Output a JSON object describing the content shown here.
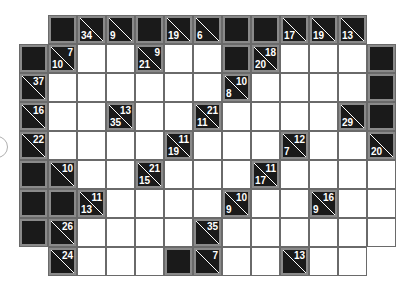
{
  "puzzle": {
    "type": "kakuro",
    "cell_size": 29,
    "origin_x": 19,
    "origin_y": 15,
    "colors": {
      "clue_bg": "#1a1a1a",
      "clue_border": "#8a8a8a",
      "white": "#ffffff",
      "grid_line": "#6a6a6a",
      "clue_text": "#ffffff"
    },
    "rows": [
      {
        "r": 0,
        "cells": [
          {
            "c": 1,
            "t": "B"
          },
          {
            "c": 2,
            "t": "C",
            "down": "34"
          },
          {
            "c": 3,
            "t": "C",
            "down": "9"
          },
          {
            "c": 4,
            "t": "B"
          },
          {
            "c": 5,
            "t": "C",
            "down": "19"
          },
          {
            "c": 6,
            "t": "C",
            "down": "6"
          },
          {
            "c": 7,
            "t": "B"
          },
          {
            "c": 8,
            "t": "B"
          },
          {
            "c": 9,
            "t": "C",
            "down": "17"
          },
          {
            "c": 10,
            "t": "C",
            "down": "19"
          },
          {
            "c": 11,
            "t": "C",
            "down": "13"
          }
        ]
      },
      {
        "r": 1,
        "cells": [
          {
            "c": 0,
            "t": "B"
          },
          {
            "c": 1,
            "t": "C",
            "across": "7",
            "down": "10"
          },
          {
            "c": 2,
            "t": "W"
          },
          {
            "c": 3,
            "t": "W"
          },
          {
            "c": 4,
            "t": "C",
            "across": "9",
            "down": "21"
          },
          {
            "c": 5,
            "t": "W"
          },
          {
            "c": 6,
            "t": "W"
          },
          {
            "c": 7,
            "t": "B"
          },
          {
            "c": 8,
            "t": "C",
            "across": "18",
            "down": "20"
          },
          {
            "c": 9,
            "t": "W"
          },
          {
            "c": 10,
            "t": "W"
          },
          {
            "c": 11,
            "t": "W"
          },
          {
            "c": 12,
            "t": "B"
          }
        ]
      },
      {
        "r": 2,
        "cells": [
          {
            "c": 0,
            "t": "C",
            "across": "37"
          },
          {
            "c": 1,
            "t": "W"
          },
          {
            "c": 2,
            "t": "W"
          },
          {
            "c": 3,
            "t": "W"
          },
          {
            "c": 4,
            "t": "W"
          },
          {
            "c": 5,
            "t": "W"
          },
          {
            "c": 6,
            "t": "W"
          },
          {
            "c": 7,
            "t": "C",
            "across": "10",
            "down": "8"
          },
          {
            "c": 8,
            "t": "W"
          },
          {
            "c": 9,
            "t": "W"
          },
          {
            "c": 10,
            "t": "W"
          },
          {
            "c": 11,
            "t": "W"
          },
          {
            "c": 12,
            "t": "B"
          }
        ]
      },
      {
        "r": 3,
        "cells": [
          {
            "c": 0,
            "t": "C",
            "across": "16"
          },
          {
            "c": 1,
            "t": "W"
          },
          {
            "c": 2,
            "t": "W"
          },
          {
            "c": 3,
            "t": "C",
            "across": "13",
            "down": "35"
          },
          {
            "c": 4,
            "t": "W"
          },
          {
            "c": 5,
            "t": "W"
          },
          {
            "c": 6,
            "t": "C",
            "across": "21",
            "down": "11"
          },
          {
            "c": 7,
            "t": "W"
          },
          {
            "c": 8,
            "t": "W"
          },
          {
            "c": 9,
            "t": "W"
          },
          {
            "c": 10,
            "t": "W"
          },
          {
            "c": 11,
            "t": "C",
            "down": "29"
          },
          {
            "c": 12,
            "t": "B"
          }
        ]
      },
      {
        "r": 4,
        "cells": [
          {
            "c": 0,
            "t": "C",
            "across": "22"
          },
          {
            "c": 1,
            "t": "W"
          },
          {
            "c": 2,
            "t": "W"
          },
          {
            "c": 3,
            "t": "W"
          },
          {
            "c": 4,
            "t": "W"
          },
          {
            "c": 5,
            "t": "C",
            "across": "11",
            "down": "19"
          },
          {
            "c": 6,
            "t": "W"
          },
          {
            "c": 7,
            "t": "W"
          },
          {
            "c": 8,
            "t": "W"
          },
          {
            "c": 9,
            "t": "C",
            "across": "12",
            "down": "7"
          },
          {
            "c": 10,
            "t": "W"
          },
          {
            "c": 11,
            "t": "W"
          },
          {
            "c": 12,
            "t": "C",
            "down": "20"
          }
        ]
      },
      {
        "r": 5,
        "cells": [
          {
            "c": 0,
            "t": "B"
          },
          {
            "c": 1,
            "t": "C",
            "across": "10"
          },
          {
            "c": 2,
            "t": "W"
          },
          {
            "c": 3,
            "t": "W"
          },
          {
            "c": 4,
            "t": "C",
            "across": "21",
            "down": "15"
          },
          {
            "c": 5,
            "t": "W"
          },
          {
            "c": 6,
            "t": "W"
          },
          {
            "c": 7,
            "t": "W"
          },
          {
            "c": 8,
            "t": "C",
            "across": "11",
            "down": "17"
          },
          {
            "c": 9,
            "t": "W"
          },
          {
            "c": 10,
            "t": "W"
          },
          {
            "c": 11,
            "t": "W"
          },
          {
            "c": 12,
            "t": "W"
          }
        ]
      },
      {
        "r": 6,
        "cells": [
          {
            "c": 0,
            "t": "B"
          },
          {
            "c": 1,
            "t": "B"
          },
          {
            "c": 2,
            "t": "C",
            "across": "11",
            "down": "13"
          },
          {
            "c": 3,
            "t": "W"
          },
          {
            "c": 4,
            "t": "W"
          },
          {
            "c": 5,
            "t": "W"
          },
          {
            "c": 6,
            "t": "W"
          },
          {
            "c": 7,
            "t": "C",
            "across": "10",
            "down": "9"
          },
          {
            "c": 8,
            "t": "W"
          },
          {
            "c": 9,
            "t": "W"
          },
          {
            "c": 10,
            "t": "C",
            "across": "16",
            "down": "9"
          },
          {
            "c": 11,
            "t": "W"
          },
          {
            "c": 12,
            "t": "W"
          }
        ]
      },
      {
        "r": 7,
        "cells": [
          {
            "c": 0,
            "t": "B"
          },
          {
            "c": 1,
            "t": "C",
            "across": "26"
          },
          {
            "c": 2,
            "t": "W"
          },
          {
            "c": 3,
            "t": "W"
          },
          {
            "c": 4,
            "t": "W"
          },
          {
            "c": 5,
            "t": "W"
          },
          {
            "c": 6,
            "t": "C",
            "across": "35"
          },
          {
            "c": 7,
            "t": "W"
          },
          {
            "c": 8,
            "t": "W"
          },
          {
            "c": 9,
            "t": "W"
          },
          {
            "c": 10,
            "t": "W"
          },
          {
            "c": 11,
            "t": "W"
          },
          {
            "c": 12,
            "t": "W"
          }
        ]
      },
      {
        "r": 8,
        "cells": [
          {
            "c": 1,
            "t": "C",
            "across": "24"
          },
          {
            "c": 2,
            "t": "W"
          },
          {
            "c": 3,
            "t": "W"
          },
          {
            "c": 4,
            "t": "W"
          },
          {
            "c": 5,
            "t": "B"
          },
          {
            "c": 6,
            "t": "C",
            "across": "7"
          },
          {
            "c": 7,
            "t": "W"
          },
          {
            "c": 8,
            "t": "W"
          },
          {
            "c": 9,
            "t": "C",
            "across": "13"
          },
          {
            "c": 10,
            "t": "W"
          },
          {
            "c": 11,
            "t": "W"
          }
        ]
      }
    ]
  }
}
